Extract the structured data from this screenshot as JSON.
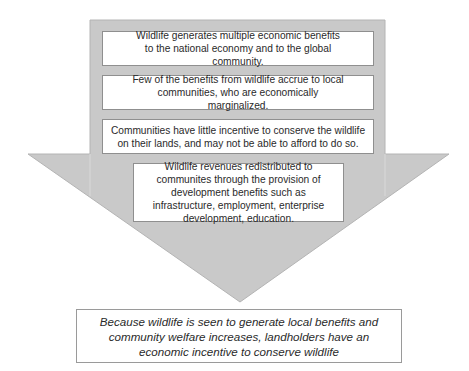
{
  "diagram": {
    "type": "flow-arrow",
    "colors": {
      "arrow_fill": "#c9c9c9",
      "arrow_edge": "#b8b8b8",
      "box_fill": "#ffffff",
      "box_border": "#8f8f8f",
      "text": "#2a2a2a"
    },
    "steps": [
      {
        "text": "Wildlife generates multiple economic benefits to the national economy and to the global community."
      },
      {
        "text": "Few of the benefits from wildlife accrue to local communities, who are economically marginalized."
      },
      {
        "text": "Communities have little incentive to conserve the wildlife on their lands, and may not be able to afford to do so."
      },
      {
        "text": "Wildlife revenues redistributed to communites through the provision of development benefits such as infrastructure, employment, enterprise development, education."
      }
    ],
    "outcome": {
      "text": "Because wildlife is seen to generate local benefits and community welfare increases, landholders have an economic incentive to conserve wildlife"
    }
  }
}
